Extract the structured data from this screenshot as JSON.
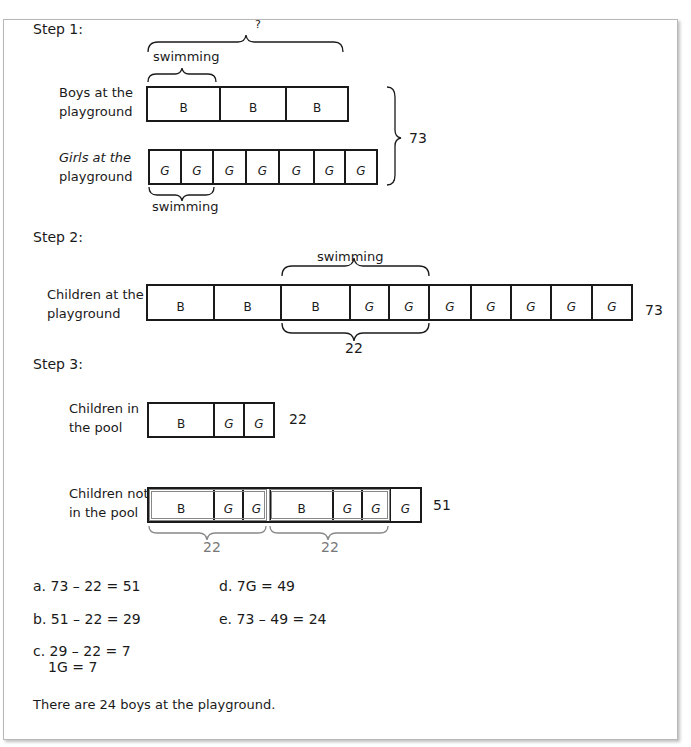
{
  "step1": {
    "title": "Step 1:",
    "question_mark": "?",
    "swimming_top": "swimming",
    "swimming_bottom": "swimming",
    "boys_label_1": "Boys at the",
    "boys_label_2": "playground",
    "girls_label_1": "Girls at the",
    "girls_label_2": "playground",
    "boys_cells": [
      "B",
      "B",
      "B"
    ],
    "girls_cells": [
      "G",
      "G",
      "G",
      "G",
      "G",
      "G",
      "G"
    ],
    "total": "73"
  },
  "step2": {
    "title": "Step 2:",
    "swimming": "swimming",
    "label_1": "Children at the",
    "label_2": "playground",
    "cells": [
      "B",
      "B",
      "B",
      "G",
      "G",
      "G",
      "G",
      "G",
      "G",
      "G"
    ],
    "total": "73",
    "swim_total": "22"
  },
  "step3": {
    "title": "Step 3:",
    "pool_label_1": "Children in",
    "pool_label_2": "the pool",
    "pool_cells": [
      "B",
      "G",
      "G"
    ],
    "pool_total": "22",
    "notpool_label_1": "Children not",
    "notpool_label_2": "in the pool",
    "notpool_cells": [
      "B",
      "G",
      "G",
      "B",
      "G",
      "G",
      "G"
    ],
    "notpool_total": "51",
    "group1_total": "22",
    "group2_total": "22"
  },
  "equations": {
    "a": "a. 73 – 22 = 51",
    "b": "b. 51 – 22 = 29",
    "c1": "c. 29 – 22 = 7",
    "c2": "1G = 7",
    "d": "d. 7G = 49",
    "e": "e. 73 – 49 = 24"
  },
  "conclusion": "There are 24 boys at the playground."
}
